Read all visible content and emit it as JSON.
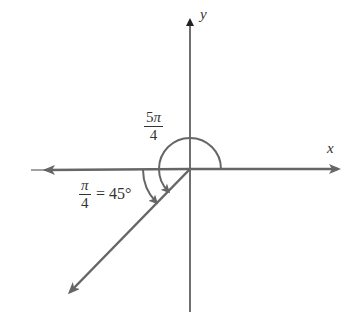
{
  "diagram": {
    "type": "angle-diagram",
    "axes": {
      "x_label": "x",
      "y_label": "y"
    },
    "angle_main": {
      "numerator_coef": "5",
      "numerator_symbol": "π",
      "denominator": "4",
      "text": "5π/4"
    },
    "reference_angle": {
      "numerator_symbol": "π",
      "denominator": "4",
      "equals_text": "= 45°",
      "text": "π/4 = 45°"
    },
    "colors": {
      "axis": "#222222",
      "ray": "#666666",
      "arc": "#666666",
      "text": "#333333"
    }
  }
}
